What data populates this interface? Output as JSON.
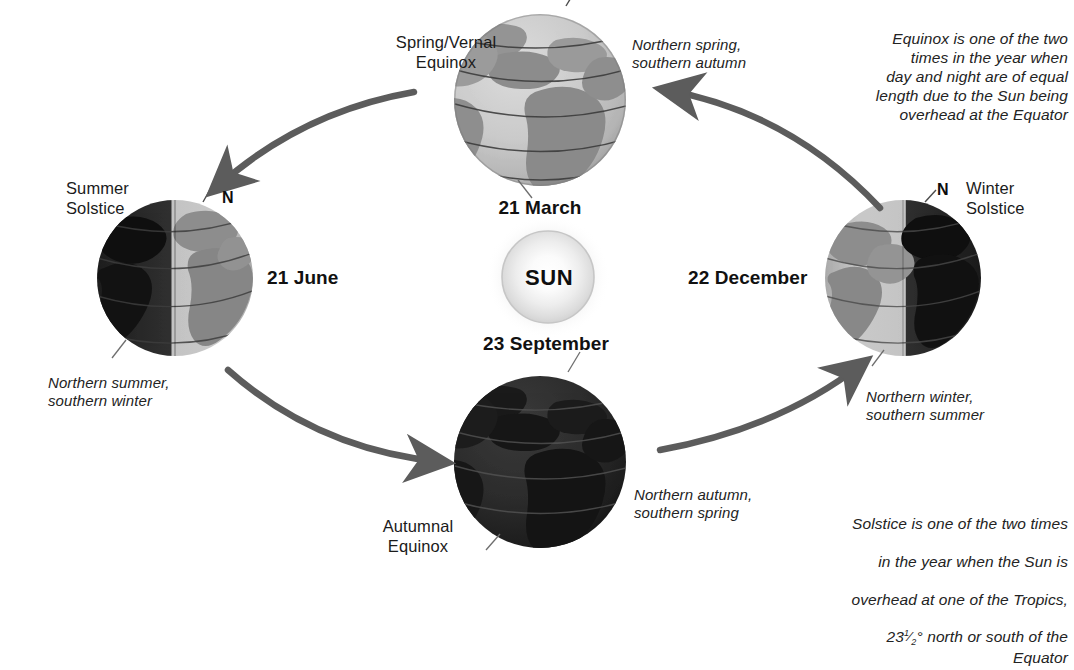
{
  "diagram": {
    "sun_label": "SUN"
  },
  "colors": {
    "arrow": "#5c5c5c",
    "globe_lit": "#c8c8c8",
    "globe_dark": "#2a2a2a",
    "globe_land_lit": "#8f8f8f",
    "globe_land_dark": "#161616",
    "text": "#1b1b1b",
    "background": "#ffffff"
  },
  "positions": {
    "top_globe": {
      "cx": 540,
      "cy": 100,
      "r": 86
    },
    "bottom_globe": {
      "cx": 540,
      "cy": 462,
      "r": 86
    },
    "left_globe": {
      "cx": 175,
      "cy": 278,
      "r": 78
    },
    "right_globe": {
      "cx": 903,
      "cy": 278,
      "r": 78
    },
    "sun": {
      "cx": 548,
      "cy": 277,
      "r": 47
    }
  },
  "globes": [
    {
      "id": "top-globe",
      "name": "spring-equinox-globe",
      "date": "21 March",
      "season_label": "Spring/Vernal\nEquinox",
      "hemisphere_note": "Northern spring,\nsouthern autumn",
      "lighting": "fully-lit",
      "pole_label": null
    },
    {
      "id": "left-globe",
      "name": "summer-solstice-globe",
      "date": "21 June",
      "season_label": "Summer\nSolstice",
      "hemisphere_note": "Northern summer,\nsouthern winter",
      "lighting": "dark-left-lit-right",
      "pole_label": "N"
    },
    {
      "id": "bottom-globe",
      "name": "autumnal-equinox-globe",
      "date": "23 September",
      "season_label": "Autumnal\nEquinox",
      "hemisphere_note": "Northern autumn,\nsouthern spring",
      "lighting": "fully-dark",
      "pole_label": null
    },
    {
      "id": "right-globe",
      "name": "winter-solstice-globe",
      "date": "22 December",
      "season_label": "Winter\nSolstice",
      "hemisphere_note": "Northern winter,\nsouthern summer",
      "lighting": "lit-left-dark-right",
      "pole_label": "N"
    }
  ],
  "notes": {
    "equinox": "Equinox is one of the two\ntimes in the year when\nday and night are of equal\nlength due to the Sun being\noverhead at the Equator",
    "solstice_line1": "Solstice is one of the two times",
    "solstice_line2": "in the year when the Sun is",
    "solstice_line3": "overhead at one of the Tropics,",
    "solstice_line4_pre": "23",
    "solstice_line4_frac_num": "1",
    "solstice_line4_frac_den": "2",
    "solstice_line4_post": "° north or south of the Equator"
  },
  "arrows": [
    {
      "name": "arrow-winter-to-spring",
      "from": "right-globe",
      "to": "top-globe",
      "direction": "counter-clockwise"
    },
    {
      "name": "arrow-spring-to-summer",
      "from": "top-globe",
      "to": "left-globe",
      "direction": "counter-clockwise"
    },
    {
      "name": "arrow-summer-to-autumn",
      "from": "left-globe",
      "to": "bottom-globe",
      "direction": "counter-clockwise"
    },
    {
      "name": "arrow-autumn-to-winter",
      "from": "bottom-globe",
      "to": "right-globe",
      "direction": "counter-clockwise"
    }
  ]
}
